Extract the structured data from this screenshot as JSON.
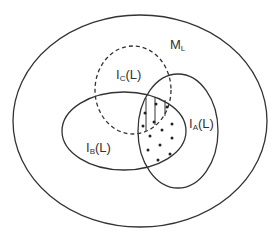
{
  "diagram": {
    "type": "venn",
    "sets": [
      {
        "id": "ML",
        "label_main": "M",
        "label_sub": "L",
        "label_suffix": "",
        "style": "solid"
      },
      {
        "id": "IA",
        "label_main": "I",
        "label_sub": "A",
        "label_suffix": "(L)",
        "style": "solid"
      },
      {
        "id": "IB",
        "label_main": "I",
        "label_sub": "B",
        "label_suffix": "(L)",
        "style": "solid"
      },
      {
        "id": "IC",
        "label_main": "I",
        "label_sub": "C",
        "label_suffix": "(L)",
        "style": "dashed"
      }
    ],
    "regions": [
      {
        "name": "IA∩IB∩IC",
        "fill": "vertical-hatch"
      },
      {
        "name": "IA∩IB",
        "fill": "dots"
      }
    ]
  }
}
